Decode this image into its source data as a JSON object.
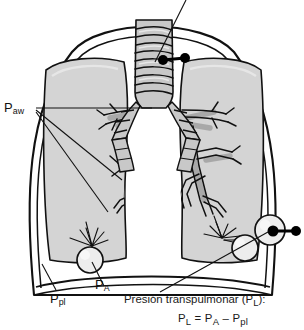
{
  "figure": {
    "language": "es",
    "type": "anatomical-diagram"
  },
  "labels": {
    "airway_pressure": {
      "symbol": "P",
      "subscript": "aw",
      "meaning": "presion en la via aerea"
    },
    "alveolar_pressure": {
      "symbol": "P",
      "subscript": "A",
      "meaning": "presion alveolar"
    },
    "pleural_pressure": {
      "symbol": "P",
      "subscript": "pl",
      "meaning": "presion pleural"
    }
  },
  "caption": {
    "title_text": "Presión transpulmonar (P",
    "title_sub": "L",
    "title_tail": "):",
    "formula_p": "P",
    "formula_sub_l": "L",
    "formula_eq": " = P",
    "formula_sub_a": "A",
    "formula_minus": " – P",
    "formula_sub_pl": "pl"
  },
  "top_cropped_text": "",
  "colors": {
    "lung_fill": "#d4d4d4",
    "lung_fill_light": "#dcdcdc",
    "airway_fill": "#c2c2c2",
    "airway_shadow": "#a9a9a9",
    "alveolus_fill": "#ececec",
    "outline": "#111111",
    "sensor": "#000000",
    "background": "#ffffff"
  },
  "elements": {
    "chest_wall": "chest-wall-outline",
    "diaphragm": "diaphragm-line",
    "trachea": "trachea-with-cartilage-rings",
    "bronchi": "bronchial-tree",
    "alveolus_left": "alveolus-left",
    "alveolus_right": "alveolus-right",
    "sensor_airway": "airway-pressure-sensor",
    "sensor_pleural": "pleural-pressure-sensor"
  }
}
